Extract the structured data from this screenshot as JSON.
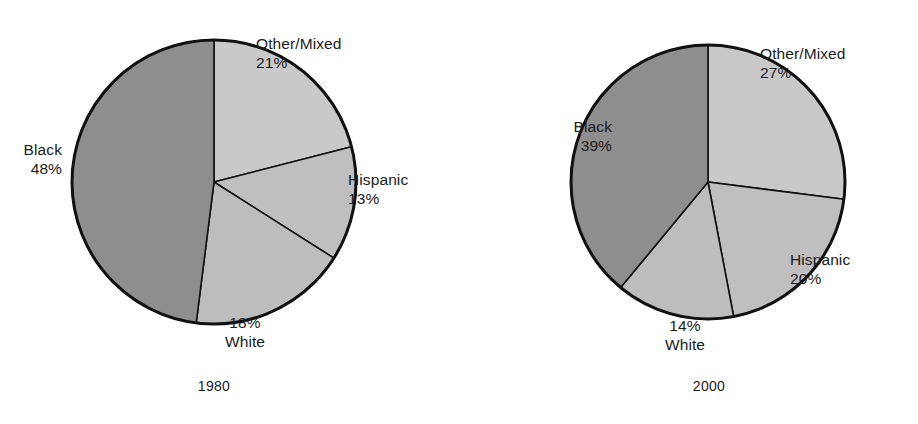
{
  "figure": {
    "title": "",
    "background": "#ffffff",
    "text_color": "#1b1b1b"
  },
  "palette": {
    "black_slice": "#8e8e8e",
    "other_mixed_slice": "#c9c9c9",
    "hispanic_slice": "#bfbfbf",
    "white_slice": "#bdbdbd",
    "outline": "#111111"
  },
  "chart_data": [
    {
      "type": "pie",
      "title": "1980",
      "xlabel": "",
      "ylabel": "",
      "legend_position": "none",
      "grid": false,
      "start_angle_deg": 0,
      "direction": "clockwise",
      "categories": [
        "Other/Mixed",
        "Hispanic",
        "White",
        "Black"
      ],
      "values": [
        21,
        13,
        18,
        48
      ],
      "labels": [
        "21%",
        "13%",
        "18%",
        "48%"
      ],
      "colors": [
        "#c9c9c9",
        "#bfbfbf",
        "#bdbdbd",
        "#8e8e8e"
      ]
    },
    {
      "type": "pie",
      "title": "2000",
      "xlabel": "",
      "ylabel": "",
      "legend_position": "none",
      "grid": false,
      "start_angle_deg": 0,
      "direction": "clockwise",
      "categories": [
        "Other/Mixed",
        "Hispanic",
        "White",
        "Black"
      ],
      "values": [
        27,
        20,
        14,
        39
      ],
      "labels": [
        "27%",
        "20%",
        "14%",
        "39%"
      ],
      "colors": [
        "#c9c9c9",
        "#bfbfbf",
        "#bdbdbd",
        "#8e8e8e"
      ]
    }
  ],
  "charts": [
    {
      "year": "1980",
      "geometry": {
        "cx": 214,
        "cy": 182,
        "r": 142
      },
      "slices": [
        {
          "name": "Other/Mixed",
          "pct": 21,
          "label": "Other/Mixed",
          "pct_label": "21%"
        },
        {
          "name": "Hispanic",
          "pct": 13,
          "label": "Hispanic",
          "pct_label": "13%"
        },
        {
          "name": "White",
          "pct": 18,
          "label": "White",
          "pct_label": "18%"
        },
        {
          "name": "Black",
          "pct": 48,
          "label": "Black",
          "pct_label": "48%"
        }
      ]
    },
    {
      "year": "2000",
      "geometry": {
        "cx": 708,
        "cy": 182,
        "r": 137
      },
      "slices": [
        {
          "name": "Other/Mixed",
          "pct": 27,
          "label": "Other/Mixed",
          "pct_label": "27%"
        },
        {
          "name": "Hispanic",
          "pct": 20,
          "label": "Hispanic",
          "pct_label": "20%"
        },
        {
          "name": "White",
          "pct": 14,
          "label": "White",
          "pct_label": "14%"
        },
        {
          "name": "Black",
          "pct": 39,
          "label": "Black",
          "pct_label": "39%"
        }
      ]
    }
  ]
}
